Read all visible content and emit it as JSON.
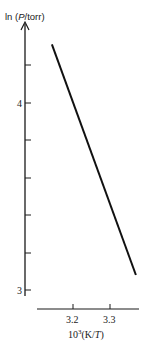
{
  "chart_data": {
    "type": "line",
    "title": "",
    "xlabel": "10^3(K/T)",
    "xlabel_parts": {
      "base": "10",
      "sup": "3",
      "rest": "(K/",
      "italic": "T",
      "close": ")"
    },
    "ylabel": "ln (P/torr)",
    "ylabel_parts": {
      "pre": "ln (",
      "italic": "P",
      "post": "/torr)"
    },
    "x_ticks": [
      3.2,
      3.3
    ],
    "x_tick_labels": [
      "3.2",
      "3.3"
    ],
    "y_ticks": [
      3.0,
      3.2,
      3.4,
      3.6,
      3.8,
      4.0,
      4.2
    ],
    "y_tick_labels": [
      "3",
      "",
      "",
      "",
      "",
      "4",
      ""
    ],
    "xlim": [
      3.1,
      3.38
    ],
    "ylim": [
      3.0,
      4.4
    ],
    "grid": false,
    "legend": null,
    "series": [
      {
        "name": "ln P vs 1/T",
        "x": [
          3.143,
          3.37
        ],
        "y": [
          4.31,
          3.08
        ]
      }
    ]
  }
}
